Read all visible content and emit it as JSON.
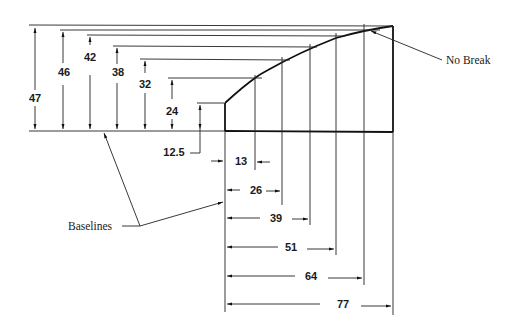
{
  "diagram": {
    "type": "dimensioned-profile",
    "heights": [
      {
        "value": "47",
        "x_pos": 77
      },
      {
        "value": "46",
        "x_pos": 64
      },
      {
        "value": "42",
        "x_pos": 51
      },
      {
        "value": "38",
        "x_pos": 39
      },
      {
        "value": "32",
        "x_pos": 26
      },
      {
        "value": "24",
        "x_pos": 13
      },
      {
        "value": "12.5",
        "x_pos": 0
      }
    ],
    "widths": [
      "13",
      "26",
      "39",
      "51",
      "64",
      "77"
    ],
    "callouts": {
      "no_break": "No Break",
      "baselines": "Baselines"
    }
  }
}
